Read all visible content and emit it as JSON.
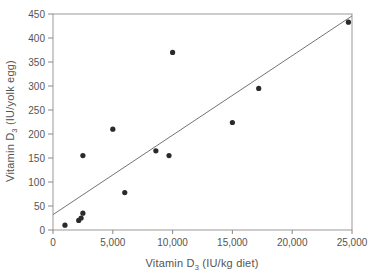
{
  "chart_data": {
    "type": "scatter",
    "title": "",
    "xlabel": {
      "text": "Vitamin D",
      "sub": "3",
      "unit": " (IU/kg diet)"
    },
    "ylabel": {
      "text": "Vitamin D",
      "sub": "3",
      "unit": " (IU/yolk egg)"
    },
    "xlim": [
      0,
      25000
    ],
    "ylim": [
      0,
      450
    ],
    "grid": false,
    "legend": "none",
    "x_ticks": [
      {
        "value": 0,
        "label": "0"
      },
      {
        "value": 5000,
        "label": "5,000"
      },
      {
        "value": 10000,
        "label": "10,000"
      },
      {
        "value": 15000,
        "label": "15,000"
      },
      {
        "value": 20000,
        "label": "20,000"
      },
      {
        "value": 25000,
        "label": "25,000"
      }
    ],
    "y_ticks": [
      {
        "value": 0,
        "label": "0"
      },
      {
        "value": 50,
        "label": "50"
      },
      {
        "value": 100,
        "label": "100"
      },
      {
        "value": 150,
        "label": "150"
      },
      {
        "value": 200,
        "label": "200"
      },
      {
        "value": 250,
        "label": "250"
      },
      {
        "value": 300,
        "label": "300"
      },
      {
        "value": 350,
        "label": "350"
      },
      {
        "value": 400,
        "label": "400"
      },
      {
        "value": 450,
        "label": "450"
      }
    ],
    "points": [
      [
        1000,
        10
      ],
      [
        2150,
        20
      ],
      [
        2350,
        25
      ],
      [
        2500,
        35
      ],
      [
        2500,
        155
      ],
      [
        5000,
        210
      ],
      [
        6000,
        78
      ],
      [
        8600,
        165
      ],
      [
        9700,
        155
      ],
      [
        10000,
        370
      ],
      [
        15000,
        224
      ],
      [
        17200,
        295
      ],
      [
        24700,
        433
      ]
    ],
    "trendline": {
      "x1": 0,
      "y1": 32,
      "x2": 25000,
      "y2": 446
    },
    "colors": {
      "point": "#2b2a28",
      "trend": "#76746f",
      "axis_box": "#9b9995",
      "tick": "#8b8986",
      "text": "#56544f",
      "background": "#ffffff"
    }
  }
}
